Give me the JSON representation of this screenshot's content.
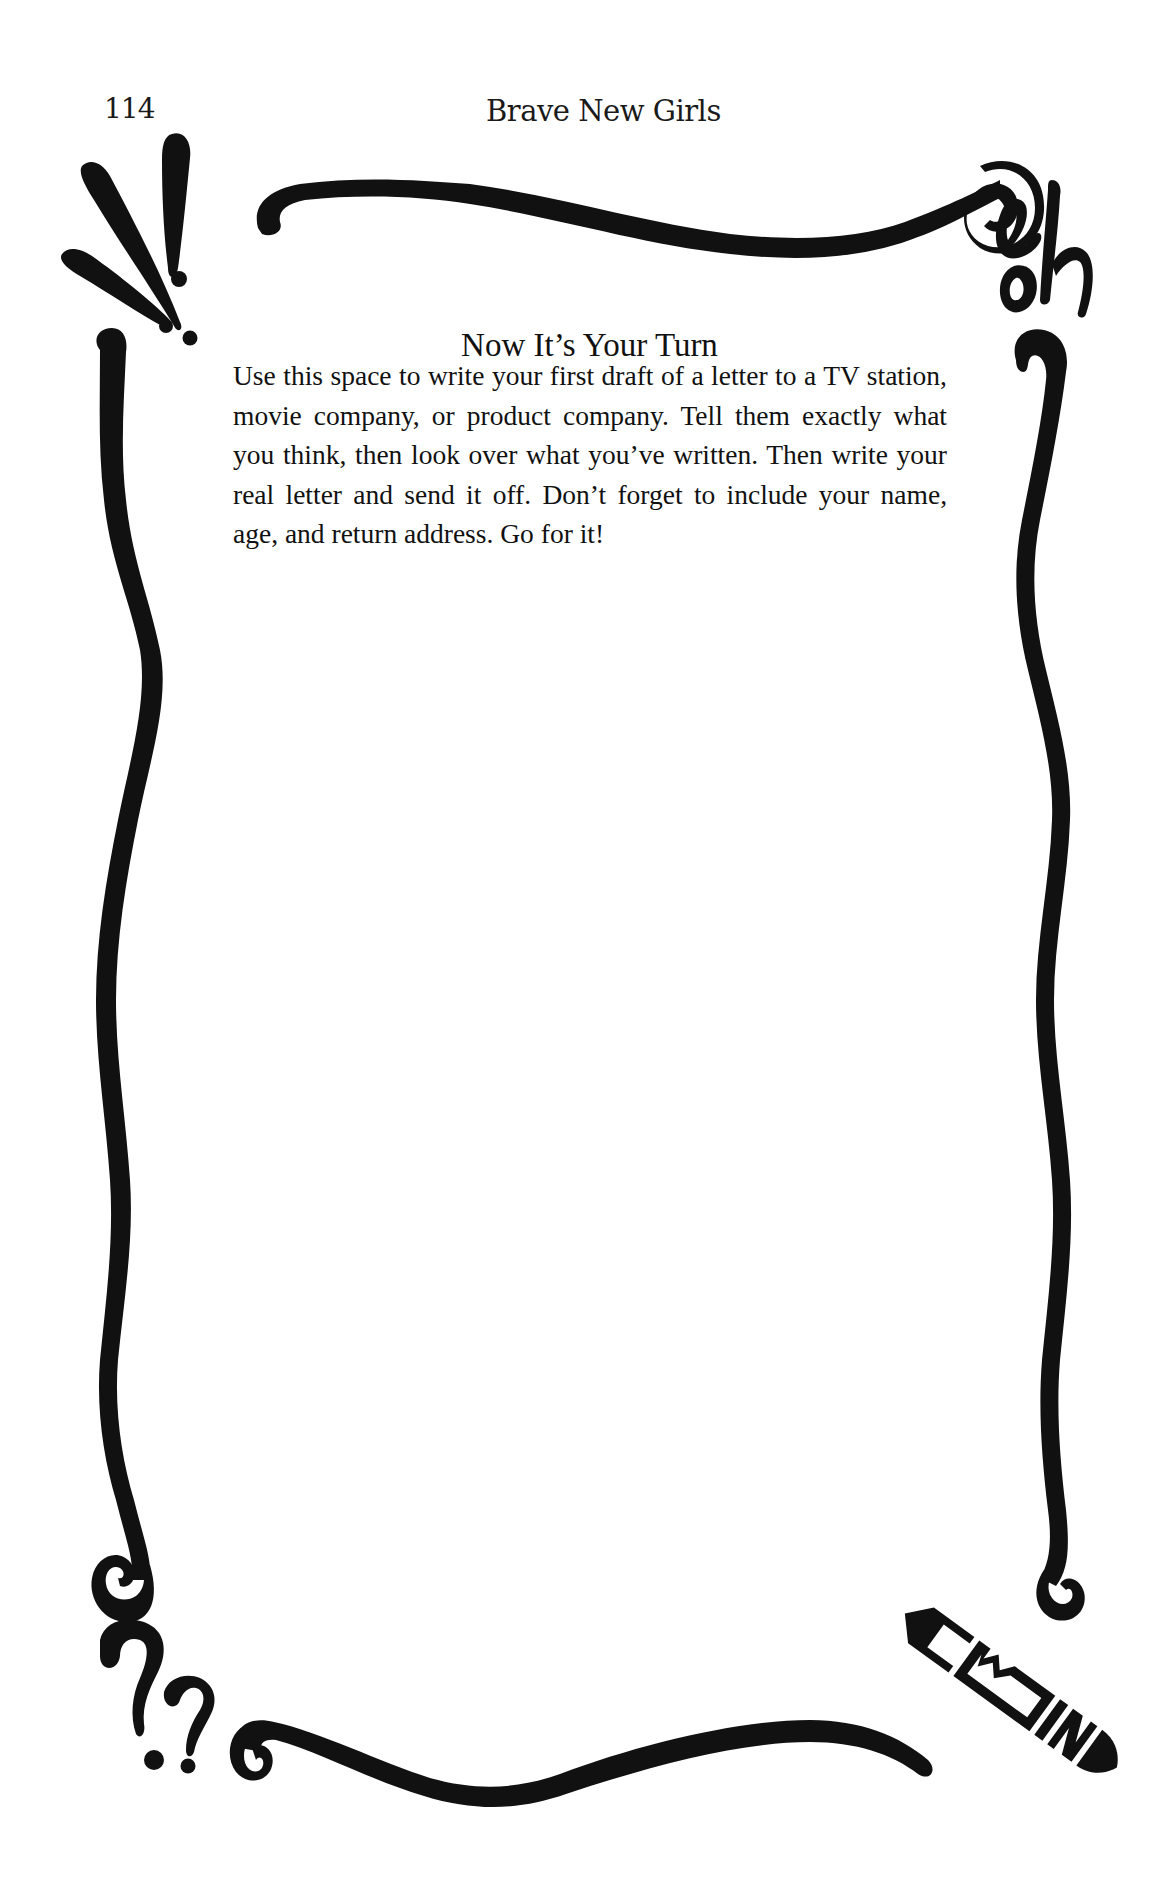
{
  "running_head": {
    "page_number": "114",
    "book_title": "Brave New Girls"
  },
  "section": {
    "heading": "Now It’s Your Turn",
    "body": "Use this space to write your first draft of a letter to a TV station, movie company, or product company. Tell them exactly what you think, then look over what you’ve written. Then write your real letter and send it off. Don’t forget to include your name, age, and return address. Go for it!"
  },
  "decorations": {
    "border": "hand-drawn swirl frame",
    "top_left": "exclamation-marks",
    "top_right": "oh-lettering",
    "bottom_left": "question-marks",
    "bottom_right": "pencil-end",
    "ink_color": "#111111"
  }
}
